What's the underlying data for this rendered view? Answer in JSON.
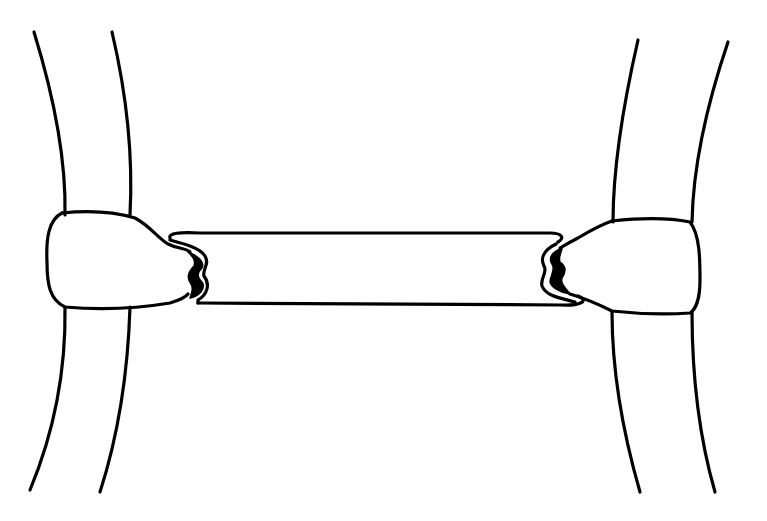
{
  "diagram": {
    "type": "line-drawing",
    "colors": {
      "stroke": "#000000",
      "background": "#ffffff"
    },
    "parts": [
      {
        "id": "left-band",
        "label": ""
      },
      {
        "id": "right-band",
        "label": ""
      },
      {
        "id": "left-junction",
        "label": ""
      },
      {
        "id": "right-junction",
        "label": ""
      },
      {
        "id": "connector",
        "label": ""
      }
    ]
  }
}
